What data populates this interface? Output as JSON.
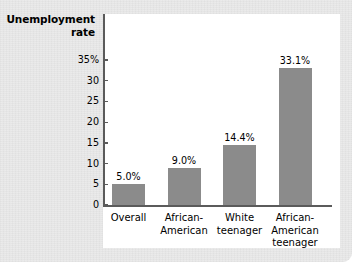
{
  "figure": {
    "axis_title": "Unemployment\nrate",
    "axis_title_line1": "Unemployment",
    "axis_title_line2": "rate",
    "bar_color": "#8b8b8b",
    "axis_color": "#5b5b5b",
    "panel_color": "#ffffff",
    "background_color": "#e9e9e9"
  },
  "chart_data": {
    "type": "bar",
    "title": "",
    "xlabel": "",
    "ylabel": "Unemployment rate",
    "categories": [
      "Overall",
      "African-American",
      "White teenager",
      "African-American teenager"
    ],
    "category_lines": [
      [
        "Overall"
      ],
      [
        "African-",
        "American"
      ],
      [
        "White",
        "teenager"
      ],
      [
        "African-",
        "American",
        "teenager"
      ]
    ],
    "values": [
      5.0,
      9.0,
      14.4,
      33.1
    ],
    "data_labels": [
      "5.0%",
      "9.0%",
      "14.4%",
      "33.1%"
    ],
    "ylim": [
      0,
      35
    ],
    "yticks": [
      0,
      5,
      10,
      15,
      20,
      25,
      30,
      35
    ],
    "ytick_labels": [
      "0",
      "5",
      "10",
      "15",
      "20",
      "25",
      "30",
      "35%"
    ],
    "grid": false,
    "legend": "none"
  }
}
